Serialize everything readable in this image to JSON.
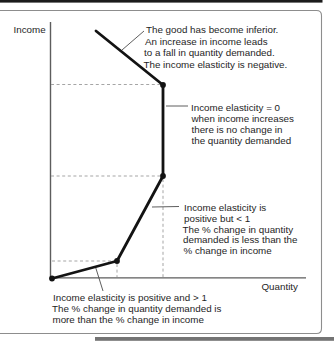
{
  "figure": {
    "y_axis_label": "Income",
    "x_axis_label": "Quantity"
  },
  "annotations": {
    "negative": {
      "lines": [
        "The good has become inferior.",
        "An increase in income leads",
        "to a fall in quantity demanded.",
        "The income elasticity is negative."
      ]
    },
    "zero": {
      "lines": [
        "Income elasticity = 0",
        "when income increases",
        "there is no change in",
        "the quantity demanded"
      ]
    },
    "positive_lt_1": {
      "lines": [
        "Income elasticity is",
        "positive but < 1",
        "The % change in quantity",
        "demanded is less than the",
        "% change in income"
      ]
    },
    "positive_gt_1": {
      "lines": [
        "Income elasticity is positive and > 1",
        "The % change in quantity demanded is",
        "more than the % change in income"
      ]
    }
  },
  "chart_data": {
    "type": "line",
    "xlabel": "Quantity",
    "ylabel": "Income",
    "grid": false,
    "curve_points_px": [
      [
        52,
        278.5
      ],
      [
        117,
        261
      ],
      [
        163,
        176
      ],
      [
        163,
        85
      ],
      [
        96,
        31
      ]
    ],
    "dot_point_indices": [
      0,
      1,
      2,
      3
    ],
    "segments": [
      {
        "elasticity": "positive and > 1",
        "note": "The % change in quantity demanded is more than the % change in income"
      },
      {
        "elasticity": "positive but < 1",
        "note": "The % change in quantity demanded is less than the % change in income"
      },
      {
        "elasticity": "= 0",
        "note": "when income increases there is no change in the quantity demanded"
      },
      {
        "elasticity": "negative",
        "note": "The good has become inferior. An increase in income leads to a fall in quantity demanded."
      }
    ]
  },
  "colors": {
    "curve": "#131313",
    "axis": "#5d5d5d",
    "dashed_guide": "#9b9b9b",
    "text": "#1e1e1e",
    "frame_border": "#8d8d8d",
    "top_rule": "#1b1b1b",
    "bottom_rule": "#747474"
  }
}
